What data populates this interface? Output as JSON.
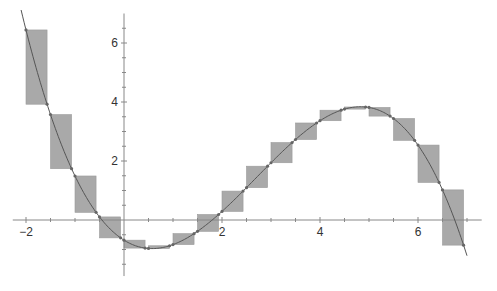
{
  "chart_data": {
    "type": "line",
    "title": "",
    "xlabel": "",
    "ylabel": "",
    "function": "f(x) = -0.125 (x + 0.45)(x - 1.8)(x - 6.75)",
    "xlim": [
      -2.27,
      7.3
    ],
    "ylim": [
      -1.9,
      7.0
    ],
    "grid": false,
    "x_ticks": [
      -2,
      2,
      4,
      6
    ],
    "y_ticks": [
      2,
      4,
      6
    ],
    "x_minor_step": 0.5,
    "y_minor_step": 0.5,
    "curve_domain": [
      -2.1,
      7.0
    ],
    "rectangles": {
      "description": "shaded boxes spanning f(a) to f(a + 0.42) on each 0.5-wide interval",
      "starts": [
        -2,
        -1.5,
        -1,
        -0.5,
        0,
        0.5,
        1,
        1.5,
        2,
        2.5,
        3,
        3.5,
        4,
        4.5,
        5,
        5.5,
        6,
        6.5
      ],
      "span": 0.43
    },
    "colors": {
      "rect_fill": "#a9a9a9",
      "curve": "#555555",
      "axis": "#888888"
    }
  }
}
